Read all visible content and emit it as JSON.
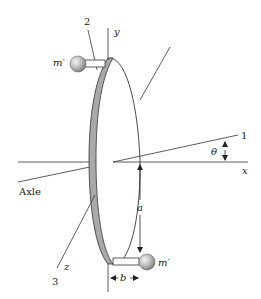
{
  "figure": {
    "labels": {
      "line_1": "1",
      "line_2": "2",
      "line_3": "3",
      "axis_x": "x",
      "axis_y": "y",
      "axis_z": "z",
      "angle": "θ",
      "axle": "Axle",
      "mass_top": "m′",
      "mass_bottom": "m′",
      "dim_a": "a",
      "dim_b": "b"
    },
    "colors": {
      "line": "#333333",
      "rim": "#a9a9a9",
      "mass": "#b8b8b8"
    }
  }
}
